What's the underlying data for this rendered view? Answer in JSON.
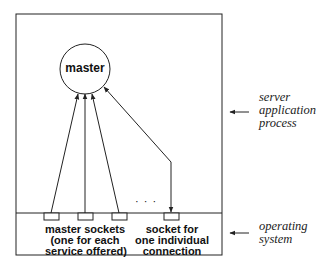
{
  "diagram": {
    "master_label": "master",
    "dots": "· · ·",
    "master_sockets_label": [
      "master sockets",
      "(one for each",
      "service offered)"
    ],
    "connection_socket_label": [
      "socket for",
      "one individual",
      "connection"
    ],
    "side_labels": {
      "server": [
        "server",
        "application",
        "process"
      ],
      "os": [
        "operating",
        "system"
      ]
    },
    "colors": {
      "line": "#222222",
      "background": "#ffffff"
    }
  }
}
